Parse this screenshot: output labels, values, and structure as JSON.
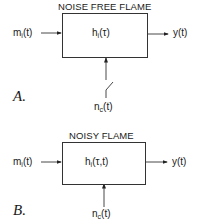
{
  "panels": [
    {
      "letter": "A.",
      "title": "NOISE FREE FLAME",
      "input": {
        "base": "m",
        "sub": "i",
        "arg": "(t)"
      },
      "transfer": {
        "base": "h",
        "sub": "i",
        "arg": "(τ)"
      },
      "output": "y(t)",
      "disturbance": {
        "base": "n",
        "sub": "c",
        "arg": "(t)"
      },
      "disturbance_switch": "open"
    },
    {
      "letter": "B.",
      "title": "NOISY  FLAME",
      "input": {
        "base": "m",
        "sub": "i",
        "arg": "(t)"
      },
      "transfer": {
        "base": "h",
        "sub": "i",
        "arg": "(τ,t)"
      },
      "output": "y(t)",
      "disturbance": {
        "base": "n",
        "sub": "c",
        "arg": "(t)"
      },
      "disturbance_switch": "closed"
    }
  ]
}
